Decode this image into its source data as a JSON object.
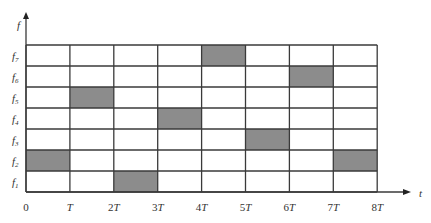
{
  "chart_data": {
    "type": "heatmap",
    "title": "",
    "xlabel": "t",
    "ylabel": "f",
    "x_ticks": [
      "0",
      "T",
      "2T",
      "3T",
      "4T",
      "5T",
      "6T",
      "7T",
      "8T"
    ],
    "y_ticks": [
      "f1",
      "f2",
      "f3",
      "f4",
      "f5",
      "f6",
      "f7"
    ],
    "grid": true,
    "cell_color": "#8c8c8c",
    "occupied_cells": [
      {
        "slot": "0-T",
        "freq": "f2"
      },
      {
        "slot": "T-2T",
        "freq": "f5"
      },
      {
        "slot": "2T-3T",
        "freq": "f1"
      },
      {
        "slot": "3T-4T",
        "freq": "f4"
      },
      {
        "slot": "4T-5T",
        "freq": "f7"
      },
      {
        "slot": "5T-6T",
        "freq": "f3"
      },
      {
        "slot": "6T-7T",
        "freq": "f6"
      },
      {
        "slot": "7T-8T",
        "freq": "f2"
      }
    ],
    "hop_sequence": [
      2,
      5,
      1,
      4,
      7,
      3,
      6,
      2
    ]
  },
  "axes": {
    "x_label": "t",
    "y_label": "f",
    "x_ticks": [
      "0",
      "T",
      "2T",
      "3T",
      "4T",
      "5T",
      "6T",
      "7T",
      "8T"
    ],
    "y_ticks": [
      {
        "base": "f",
        "sub": "7"
      },
      {
        "base": "f",
        "sub": "6"
      },
      {
        "base": "f",
        "sub": "5"
      },
      {
        "base": "f",
        "sub": "4"
      },
      {
        "base": "f",
        "sub": "3"
      },
      {
        "base": "f",
        "sub": "2"
      },
      {
        "base": "f",
        "sub": "1"
      }
    ]
  }
}
